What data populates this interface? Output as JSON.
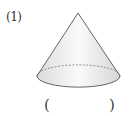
{
  "problem": {
    "number_label": "(1)",
    "shape": "cone",
    "answer_open": "(",
    "answer_close": ")",
    "answer_value": ""
  },
  "colors": {
    "outline": "#555555",
    "fill_light": "#f4f4f4",
    "fill_shade": "#d8d8d8"
  }
}
